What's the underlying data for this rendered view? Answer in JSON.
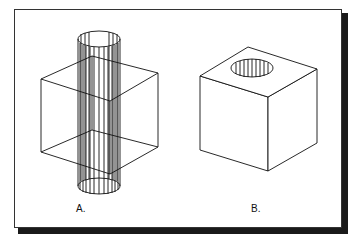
{
  "figure": {
    "panels": [
      {
        "id": "A",
        "label": "A.",
        "description": "Wireframe cube pierced by a vertical cylinder (ruled surface)"
      },
      {
        "id": "B",
        "label": "B.",
        "description": "Solid cube with a cylindrical hole in its top face"
      }
    ],
    "colors": {
      "background": "#ffffff",
      "line": "#111111",
      "frame_border": "#333333",
      "frame_shadow": "#1a1a1a"
    }
  }
}
